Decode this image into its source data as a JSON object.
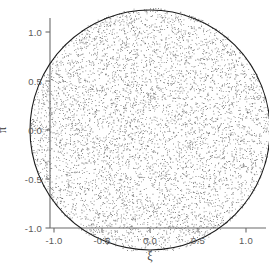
{
  "chart_data": {
    "type": "scatter",
    "title": "",
    "subtitle": "",
    "xlabel": "ξ",
    "ylabel": "π",
    "xticks": [
      "-1.0",
      "-0.5",
      "0.0",
      "0.5",
      "1.0"
    ],
    "xtick_values": [
      -1.0,
      -0.5,
      0.0,
      0.5,
      1.0
    ],
    "yticks": [
      "-1.0",
      "-0.5",
      "0.0",
      "0.5",
      "1.0"
    ],
    "ytick_values": [
      -1.0,
      -0.5,
      0.0,
      0.5,
      1.0
    ],
    "xlim": [
      -1.4,
      1.42
    ],
    "ylim": [
      -1.28,
      1.35
    ],
    "grid": false,
    "legend": false,
    "legend_position": "none",
    "series": [
      {
        "name": "uniform disk sample",
        "marker": "point",
        "marker_size": 0.85,
        "color": "#555555",
        "n_points": 6000,
        "distribution": "uniform-in-disk",
        "center": [
          0.0,
          0.0
        ],
        "radius": 1.25
      }
    ],
    "annotations": [
      {
        "kind": "circle-boundary",
        "center": [
          0.0,
          0.0
        ],
        "radius": 1.25,
        "color": "#1a1a1a",
        "linewidth": 1.1
      }
    ]
  },
  "axes": {
    "spine_color": "#6b6b6b",
    "tick_color": "#6b6b6b",
    "background": "#ffffff"
  }
}
